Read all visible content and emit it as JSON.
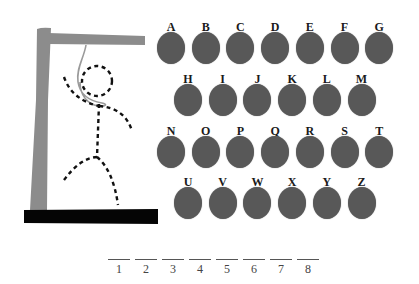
{
  "game": {
    "title": "Hangman",
    "colors": {
      "key_fill": "#585858",
      "gallows": "#8c8c8c",
      "base": "#000000",
      "figure": "#111111",
      "rope": "#9a9a9a"
    },
    "figure_parts_shown": [
      "head",
      "body",
      "left-arm",
      "right-arm",
      "left-leg",
      "right-leg",
      "rope"
    ]
  },
  "keyboard": {
    "rows": [
      [
        "A",
        "B",
        "C",
        "D",
        "E",
        "F",
        "G"
      ],
      [
        "H",
        "I",
        "J",
        "K",
        "L",
        "M"
      ],
      [
        "N",
        "O",
        "P",
        "Q",
        "R",
        "S",
        "T"
      ],
      [
        "U",
        "V",
        "W",
        "X",
        "Y",
        "Z"
      ]
    ]
  },
  "word": {
    "length": 8,
    "blanks": [
      {
        "position": "1",
        "letter": ""
      },
      {
        "position": "2",
        "letter": ""
      },
      {
        "position": "3",
        "letter": ""
      },
      {
        "position": "4",
        "letter": ""
      },
      {
        "position": "5",
        "letter": ""
      },
      {
        "position": "6",
        "letter": ""
      },
      {
        "position": "7",
        "letter": ""
      },
      {
        "position": "8",
        "letter": ""
      }
    ]
  }
}
